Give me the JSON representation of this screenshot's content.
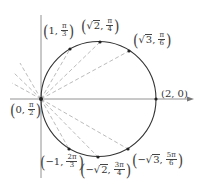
{
  "diagram": {
    "curve": {
      "type": "circle",
      "center_px": [
        98.5,
        99
      ],
      "radius_px": 57.5,
      "color": "#333333"
    },
    "axes": {
      "horizontal": {
        "x1": 10,
        "x2": 193,
        "y": 99,
        "arrow": true
      },
      "vertical": {
        "x": 41,
        "y1": 15,
        "y2": 178
      }
    },
    "dash_color": "#aaaaaa",
    "points": [
      {
        "id": "p0",
        "px": [
          41,
          99
        ],
        "r": "0",
        "theta_num": "π",
        "theta_den": "2",
        "neg": false,
        "sqrt": false
      },
      {
        "id": "p1",
        "px": [
          70,
          49
        ],
        "r": "1",
        "theta_num": "π",
        "theta_den": "3",
        "neg": false,
        "sqrt": false
      },
      {
        "id": "p2",
        "px": [
          100,
          42
        ],
        "r": "2",
        "theta_num": "π",
        "theta_den": "4",
        "neg": false,
        "sqrt": true
      },
      {
        "id": "p3",
        "px": [
          129,
          51
        ],
        "r": "3",
        "theta_num": "π",
        "theta_den": "6",
        "neg": false,
        "sqrt": true
      },
      {
        "id": "p4",
        "px": [
          156,
          99
        ],
        "r": "2",
        "theta": "0",
        "neg": false,
        "sqrt": false
      },
      {
        "id": "p5",
        "px": [
          69,
          149
        ],
        "r": "1",
        "theta_num": "2π",
        "theta_den": "3",
        "neg": true,
        "sqrt": false
      },
      {
        "id": "p6",
        "px": [
          98,
          157
        ],
        "r": "2",
        "theta_num": "3π",
        "theta_den": "4",
        "neg": true,
        "sqrt": true
      },
      {
        "id": "p7",
        "px": [
          128,
          149
        ],
        "r": "3",
        "theta_num": "5π",
        "theta_den": "6",
        "neg": true,
        "sqrt": true
      }
    ],
    "labels": {
      "p0": {
        "r": "0",
        "num": "π",
        "den": "2"
      },
      "p1": {
        "r": "1",
        "num": "π",
        "den": "3"
      },
      "p2": {
        "r": "2",
        "num": "π",
        "den": "4"
      },
      "p3": {
        "r": "3",
        "num": "π",
        "den": "6"
      },
      "p4": {
        "text": "(2, 0)"
      },
      "p5": {
        "r": "1",
        "num": "2π",
        "den": "3"
      },
      "p6": {
        "r": "2",
        "num": "3π",
        "den": "4"
      },
      "p7": {
        "r": "3",
        "num": "5π",
        "den": "6"
      }
    },
    "symbols": {
      "minus": "−",
      "sqrt": "√",
      "comma": ",",
      "lparen": "(",
      "rparen": ")"
    }
  }
}
